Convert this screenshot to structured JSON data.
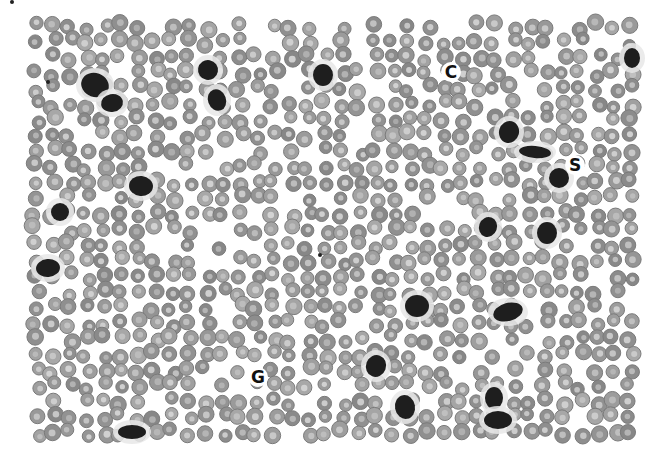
{
  "image": {
    "kind": "grayscale blood smear micrograph",
    "width": 662,
    "height": 464,
    "field": {
      "x": 30,
      "y": 20,
      "w": 610,
      "h": 420
    },
    "background": "#ffffff",
    "rbc_fill": "#9a9a9a",
    "rbc_ring": "#7a7a7a",
    "rbc_center": "#d8d8d8",
    "dark_cell_fill": "#1e1e1e"
  },
  "dark_cells": [
    {
      "x": 95,
      "y": 85,
      "rx": 14,
      "ry": 12,
      "rot": 20
    },
    {
      "x": 112,
      "y": 103,
      "rx": 11,
      "ry": 9,
      "rot": -10
    },
    {
      "x": 208,
      "y": 70,
      "rx": 10,
      "ry": 10,
      "rot": 10
    },
    {
      "x": 217,
      "y": 100,
      "rx": 9,
      "ry": 11,
      "rot": -20
    },
    {
      "x": 323,
      "y": 75,
      "rx": 10,
      "ry": 11,
      "rot": 0
    },
    {
      "x": 141,
      "y": 186,
      "rx": 12,
      "ry": 10,
      "rot": 5
    },
    {
      "x": 60,
      "y": 212,
      "rx": 9,
      "ry": 9,
      "rot": 0
    },
    {
      "x": 48,
      "y": 268,
      "rx": 12,
      "ry": 9,
      "rot": -5
    },
    {
      "x": 509,
      "y": 132,
      "rx": 10,
      "ry": 11,
      "rot": 15
    },
    {
      "x": 535,
      "y": 152,
      "rx": 16,
      "ry": 6,
      "rot": 5
    },
    {
      "x": 559,
      "y": 178,
      "rx": 10,
      "ry": 10,
      "rot": 0
    },
    {
      "x": 488,
      "y": 227,
      "rx": 9,
      "ry": 10,
      "rot": 20
    },
    {
      "x": 547,
      "y": 233,
      "rx": 10,
      "ry": 11,
      "rot": 0
    },
    {
      "x": 417,
      "y": 306,
      "rx": 12,
      "ry": 11,
      "rot": 0
    },
    {
      "x": 508,
      "y": 312,
      "rx": 15,
      "ry": 9,
      "rot": -15
    },
    {
      "x": 376,
      "y": 366,
      "rx": 10,
      "ry": 11,
      "rot": 20
    },
    {
      "x": 405,
      "y": 407,
      "rx": 10,
      "ry": 12,
      "rot": -10
    },
    {
      "x": 494,
      "y": 398,
      "rx": 9,
      "ry": 11,
      "rot": 0
    },
    {
      "x": 498,
      "y": 420,
      "rx": 14,
      "ry": 9,
      "rot": 0
    },
    {
      "x": 132,
      "y": 432,
      "rx": 14,
      "ry": 7,
      "rot": 0
    },
    {
      "x": 632,
      "y": 58,
      "rx": 8,
      "ry": 10,
      "rot": 0
    }
  ],
  "curved_marks": [
    {
      "x": 451,
      "y": 72,
      "glyph": "C"
    },
    {
      "x": 575,
      "y": 165,
      "glyph": "S"
    },
    {
      "x": 258,
      "y": 377,
      "glyph": "G"
    }
  ],
  "specks": [
    {
      "x": 48,
      "y": 82
    },
    {
      "x": 12,
      "y": 2
    },
    {
      "x": 320,
      "y": 255
    }
  ],
  "rbc": {
    "spacing": 17,
    "radius": 7.2,
    "seed": 7
  },
  "caption": "Peripheral blood smear micrograph showing red blood cells with scattered dark-staining white cells"
}
